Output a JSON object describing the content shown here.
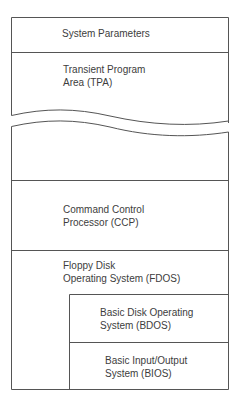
{
  "diagram": {
    "type": "memory-map",
    "colors": {
      "line": "#555555",
      "text": "#3d3d3d",
      "background": "#ffffff"
    },
    "regions": [
      {
        "id": "system-parameters",
        "lines": [
          "System Parameters"
        ]
      },
      {
        "id": "tpa",
        "lines": [
          "Transient Program",
          "Area (TPA)"
        ]
      },
      {
        "id": "ccp",
        "lines": [
          "Command Control",
          "Processor (CCP)"
        ]
      },
      {
        "id": "fdos",
        "lines": [
          "Floppy Disk",
          "Operating System (FDOS)"
        ]
      },
      {
        "id": "bdos",
        "lines": [
          "Basic Disk Operating",
          "System (BDOS)"
        ]
      },
      {
        "id": "bios",
        "lines": [
          "Basic Input/Output",
          "System (BIOS)"
        ]
      }
    ]
  }
}
